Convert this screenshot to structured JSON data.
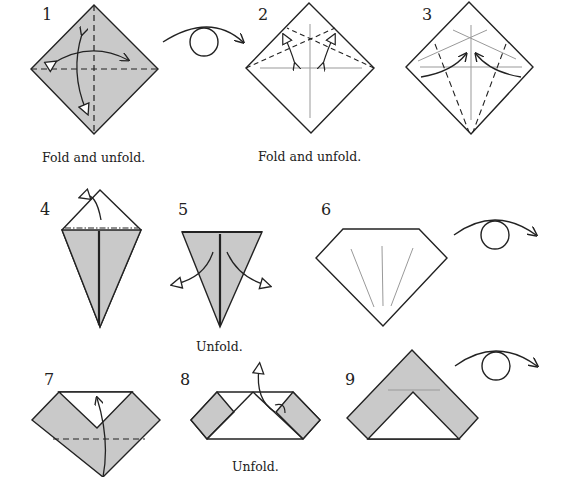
{
  "colors": {
    "paper_colored": "#c9c9c9",
    "paper_white": "#ffffff",
    "line": "#222222",
    "crease": "#999999"
  },
  "steps": [
    {
      "number": "1",
      "caption": "Fold and unfold.",
      "shape": "square-diamond",
      "side": "colored"
    },
    {
      "number": "2",
      "caption": "Fold and unfold.",
      "shape": "square-diamond",
      "side": "white"
    },
    {
      "number": "3",
      "caption": "",
      "shape": "square-diamond",
      "side": "white"
    },
    {
      "number": "4",
      "caption": "",
      "shape": "kite",
      "side": "colored"
    },
    {
      "number": "5",
      "caption": "Unfold.",
      "shape": "triangle",
      "side": "colored"
    },
    {
      "number": "6",
      "caption": "",
      "shape": "pentagon-gem",
      "side": "white"
    },
    {
      "number": "7",
      "caption": "",
      "shape": "heart-like",
      "side": "colored"
    },
    {
      "number": "8",
      "caption": "Unfold.",
      "shape": "trapezoid",
      "side": "white"
    },
    {
      "number": "9",
      "caption": "",
      "shape": "chevron",
      "side": "colored"
    }
  ],
  "symbols": {
    "turn_over": "turn-over-icon",
    "fold_unfold": "fold-unfold-arrow-icon",
    "unfold": "unfold-arrow-icon"
  }
}
